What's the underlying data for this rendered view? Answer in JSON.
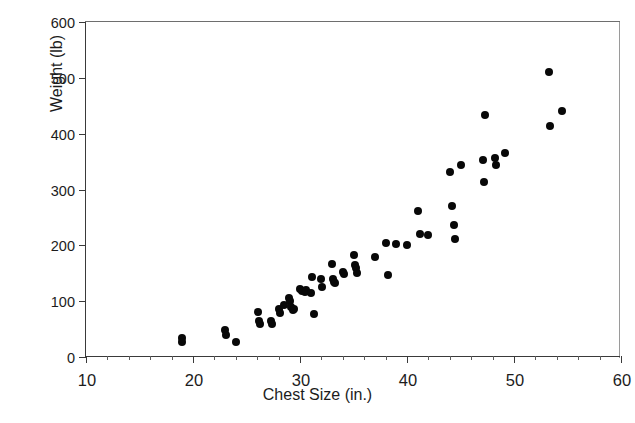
{
  "figure": {
    "top_clipped_caption": "",
    "background_color": "#ffffff",
    "marker_color": "#080808",
    "axis_color": "#3a3a3a"
  },
  "chart_data": {
    "type": "scatter",
    "title": "",
    "xlabel": "Chest Size (in.)",
    "ylabel": "Weight (lb)",
    "xlim": [
      10,
      60
    ],
    "ylim": [
      0,
      600
    ],
    "xticks": [
      10,
      20,
      30,
      40,
      50,
      60
    ],
    "yticks": [
      0,
      100,
      200,
      300,
      400,
      500,
      600
    ],
    "xtick_labels": [
      "10",
      "20",
      "30",
      "40",
      "50",
      "60"
    ],
    "ytick_labels": [
      "0",
      "100",
      "200",
      "300",
      "400",
      "500",
      "600"
    ],
    "grid": false,
    "legend": null,
    "series": [
      {
        "name": "Bears",
        "marker": "filled-circle",
        "color": "#080808",
        "points": [
          [
            19.0,
            34
          ],
          [
            19.0,
            26
          ],
          [
            23.0,
            48
          ],
          [
            23.1,
            40
          ],
          [
            24.0,
            27
          ],
          [
            26.1,
            80
          ],
          [
            26.2,
            65
          ],
          [
            26.3,
            60
          ],
          [
            27.3,
            65
          ],
          [
            27.4,
            60
          ],
          [
            28.0,
            86
          ],
          [
            28.1,
            78
          ],
          [
            28.5,
            94
          ],
          [
            29.0,
            105
          ],
          [
            29.1,
            100
          ],
          [
            29.2,
            90
          ],
          [
            29.3,
            85
          ],
          [
            29.4,
            86
          ],
          [
            30.0,
            122
          ],
          [
            30.2,
            118
          ],
          [
            30.5,
            116
          ],
          [
            30.6,
            120
          ],
          [
            31.0,
            114
          ],
          [
            31.1,
            144
          ],
          [
            31.3,
            77
          ],
          [
            32.0,
            140
          ],
          [
            32.1,
            125
          ],
          [
            33.0,
            166
          ],
          [
            33.1,
            140
          ],
          [
            33.2,
            135
          ],
          [
            33.3,
            132
          ],
          [
            34.0,
            152
          ],
          [
            34.1,
            148
          ],
          [
            35.0,
            182
          ],
          [
            35.1,
            165
          ],
          [
            35.2,
            160
          ],
          [
            35.3,
            150
          ],
          [
            37.0,
            180
          ],
          [
            38.0,
            204
          ],
          [
            38.2,
            146
          ],
          [
            39.0,
            202
          ],
          [
            40.0,
            200
          ],
          [
            41.0,
            262
          ],
          [
            41.2,
            220
          ],
          [
            42.0,
            218
          ],
          [
            44.0,
            332
          ],
          [
            44.2,
            270
          ],
          [
            44.4,
            236
          ],
          [
            44.5,
            212
          ],
          [
            45.0,
            344
          ],
          [
            47.1,
            353
          ],
          [
            47.2,
            314
          ],
          [
            48.2,
            357
          ],
          [
            48.3,
            344
          ],
          [
            47.3,
            434
          ],
          [
            49.2,
            366
          ],
          [
            53.3,
            511
          ],
          [
            53.4,
            414
          ],
          [
            54.5,
            441
          ]
        ]
      }
    ]
  }
}
